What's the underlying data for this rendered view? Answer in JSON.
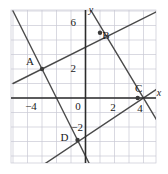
{
  "figure": {
    "title": "",
    "background_color": "#ffffff",
    "grid_color": "#c9c9d4",
    "axis_color": "#2b2b2b",
    "line_color": "#4a4a4a",
    "point_color": "#3a3a3a",
    "text_color": "#1a1a1a"
  },
  "axes": {
    "x_name": "x",
    "y_name": "y",
    "origin_label": "0",
    "x_tick_labels": [
      "−4",
      "2",
      "4"
    ],
    "y_tick_labels": [
      "6",
      "2",
      "−2"
    ],
    "x_range": [
      -5,
      5
    ],
    "y_range": [
      -4.5,
      6.5
    ],
    "grid": true,
    "grid_step": 1
  },
  "chart_data": {
    "type": "line",
    "title": "",
    "xlabel": "x",
    "ylabel": "y",
    "xlim": [
      -5,
      5
    ],
    "ylim": [
      -4.5,
      6.5
    ],
    "grid": true,
    "legend": "none",
    "xticks": [
      -4,
      2,
      4
    ],
    "yticks": [
      6,
      2,
      -2
    ],
    "series": [
      {
        "name": "line-1",
        "comment": "shallow positive slope through A(-3,2) and C(4,0)? no — through A and D-region",
        "slope": 0.5,
        "intercept": 3.5,
        "x": [
          -5,
          5
        ],
        "y": [
          1.0,
          6.0
        ]
      },
      {
        "name": "line-2",
        "comment": "steep negative slope through A(-3,2) and D(-0.5,-3)",
        "slope": -2.0,
        "intercept": -4.0,
        "x": [
          -5,
          1.2
        ],
        "y": [
          6.0,
          -6.4
        ]
      },
      {
        "name": "line-3",
        "comment": "negative slope through B(1,5) and C(4,0)",
        "slope": -1.667,
        "intercept": 6.667,
        "x": [
          -0.2,
          5
        ],
        "y": [
          7.0,
          -1.67
        ]
      },
      {
        "name": "line-4",
        "comment": "positive slope through D(-0.5,-3) and C(4,0)",
        "slope": 0.667,
        "intercept": -2.667,
        "x": [
          -5,
          5
        ],
        "y": [
          -6.0,
          0.67
        ]
      }
    ],
    "points": [
      {
        "label": "A",
        "x": -3,
        "y": 2,
        "label_dx": -12,
        "label_dy": -4
      },
      {
        "label": "B",
        "x": 1,
        "y": 4.5,
        "label_dx": 6,
        "label_dy": 6
      },
      {
        "label": "C",
        "x": 3.6,
        "y": 0,
        "label_dx": 1,
        "label_dy": -6
      },
      {
        "label": "D",
        "x": -0.55,
        "y": -2.9,
        "label_dx": -13,
        "label_dy": 1
      }
    ]
  }
}
